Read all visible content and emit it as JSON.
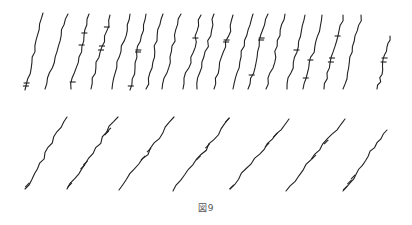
{
  "figure": {
    "caption": "図9",
    "stroke_color": "#222222",
    "background": "#ffffff"
  },
  "rows": [
    {
      "name": "upper-row",
      "orientation": "steep",
      "strands": [
        {
          "top": [
            43,
            13
          ],
          "bottom": [
            25,
            90
          ],
          "marks": [
            83,
            86
          ]
        },
        {
          "top": [
            68,
            14
          ],
          "bottom": [
            45,
            89
          ],
          "marks": []
        },
        {
          "top": [
            89,
            14
          ],
          "bottom": [
            71,
            89
          ],
          "marks": [
            33,
            45,
            82
          ]
        },
        {
          "top": [
            110,
            15
          ],
          "bottom": [
            91,
            89
          ],
          "marks": [
            27,
            46,
            50
          ]
        },
        {
          "top": [
            130,
            14
          ],
          "bottom": [
            112,
            89
          ],
          "marks": []
        },
        {
          "top": [
            146,
            14
          ],
          "bottom": [
            130,
            90
          ],
          "marks": [
            50,
            52,
            86
          ]
        },
        {
          "top": [
            163,
            14
          ],
          "bottom": [
            146,
            89
          ],
          "marks": []
        },
        {
          "top": [
            181,
            14
          ],
          "bottom": [
            162,
            89
          ],
          "marks": []
        },
        {
          "top": [
            201,
            15
          ],
          "bottom": [
            183,
            89
          ],
          "marks": [
            38
          ]
        },
        {
          "top": [
            214,
            14
          ],
          "bottom": [
            197,
            89
          ],
          "marks": []
        },
        {
          "top": [
            233,
            15
          ],
          "bottom": [
            214,
            89
          ],
          "marks": [
            40,
            42
          ]
        },
        {
          "top": [
            253,
            14
          ],
          "bottom": [
            233,
            89
          ],
          "marks": []
        },
        {
          "top": [
            268,
            14
          ],
          "bottom": [
            248,
            89
          ],
          "marks": [
            38,
            40,
            75
          ]
        },
        {
          "top": [
            285,
            14
          ],
          "bottom": [
            266,
            89
          ],
          "marks": []
        },
        {
          "top": [
            305,
            15
          ],
          "bottom": [
            287,
            89
          ],
          "marks": [
            50
          ]
        },
        {
          "top": [
            322,
            15
          ],
          "bottom": [
            303,
            89
          ],
          "marks": [
            60,
            78
          ]
        },
        {
          "top": [
            343,
            15
          ],
          "bottom": [
            324,
            89
          ],
          "marks": [
            36,
            58,
            62
          ]
        },
        {
          "top": [
            361,
            15
          ],
          "bottom": [
            343,
            89
          ],
          "marks": []
        },
        {
          "top": [
            390,
            36
          ],
          "bottom": [
            377,
            89
          ],
          "marks": [
            58,
            62
          ]
        }
      ]
    },
    {
      "name": "lower-row",
      "orientation": "diagonal",
      "strands": [
        {
          "top": [
            67,
            117
          ],
          "bottom": [
            25,
            189
          ],
          "marks": [
            185
          ]
        },
        {
          "top": [
            118,
            117
          ],
          "bottom": [
            67,
            189
          ],
          "marks": [
            130,
            133,
            163,
            167,
            185
          ]
        },
        {
          "top": [
            174,
            117
          ],
          "bottom": [
            119,
            190
          ],
          "marks": [
            150,
            158
          ]
        },
        {
          "top": [
            229,
            118
          ],
          "bottom": [
            173,
            191
          ],
          "marks": [
            120,
            146,
            158
          ]
        },
        {
          "top": [
            289,
            119
          ],
          "bottom": [
            230,
            189
          ],
          "marks": [
            135,
            145,
            187
          ]
        },
        {
          "top": [
            345,
            119
          ],
          "bottom": [
            286,
            191
          ],
          "marks": [
            142,
            157
          ]
        },
        {
          "top": [
            387,
            130
          ],
          "bottom": [
            343,
            191
          ],
          "marks": [
            177,
            182,
            188
          ]
        }
      ]
    }
  ]
}
